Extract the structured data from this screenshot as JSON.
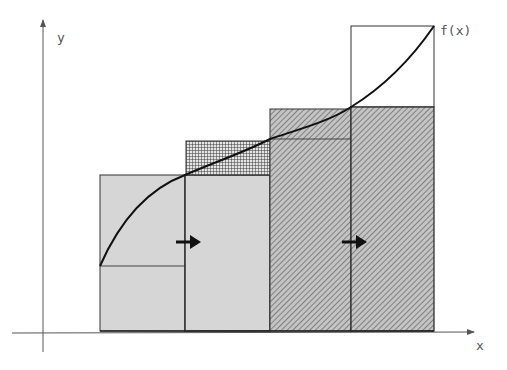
{
  "labels": {
    "y_axis": "y",
    "x_axis": "x",
    "function": "f(x)"
  },
  "colors": {
    "fill_light": "#d6d6d6",
    "hatch_bg": "#c4c4c4",
    "hatch_line": "#6e6e6e",
    "grid_line": "#3a3a3a",
    "stroke": "#222222",
    "axis": "#555555"
  },
  "diagram": {
    "rectangles": [
      {
        "name": "rect-1",
        "x0": 100,
        "x1": 185,
        "top": 175,
        "inner_line": 266,
        "fill": "light-gray"
      },
      {
        "name": "rect-2",
        "x0": 185,
        "x1": 270,
        "top": 175,
        "crosshatch_top": 141,
        "fill": "light-gray"
      },
      {
        "name": "rect-3",
        "x0": 270,
        "x1": 351,
        "top": 109,
        "inner_line": 139,
        "fill": "diagonal-hatch"
      },
      {
        "name": "rect-4",
        "x0": 351,
        "x1": 434,
        "top": 107,
        "outline_top": 26,
        "fill": "diagonal-hatch"
      }
    ],
    "curve_points": [
      [
        100,
        266
      ],
      [
        185,
        175
      ],
      [
        270,
        139
      ],
      [
        351,
        107
      ],
      [
        434,
        26
      ]
    ],
    "arrows": [
      {
        "name": "shift-arrow-1",
        "x": 177,
        "y": 242
      },
      {
        "name": "shift-arrow-2",
        "x": 343,
        "y": 242
      }
    ]
  }
}
